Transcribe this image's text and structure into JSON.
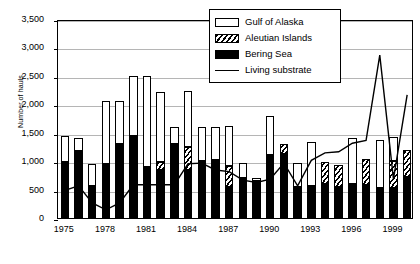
{
  "chart_data": {
    "type": "bar",
    "title": "",
    "xlabel": "",
    "ylabel": "Number of hauls",
    "ylim": [
      0,
      3500
    ],
    "ytick_labels": [
      "0",
      "500",
      "1,000",
      "1,500",
      "2,000",
      "2,500",
      "3,000",
      "3,500"
    ],
    "ytick_values": [
      0,
      500,
      1000,
      1500,
      2000,
      2500,
      3000,
      3500
    ],
    "grid": true,
    "stacked": true,
    "legend_position": "top-right",
    "categories": [
      1975,
      1976,
      1977,
      1978,
      1979,
      1980,
      1981,
      1982,
      1983,
      1984,
      1985,
      1986,
      1987,
      1988,
      1989,
      1990,
      1991,
      1992,
      1993,
      1994,
      1995,
      1996,
      1997,
      1998,
      1999,
      2000
    ],
    "xtick_labels": [
      "1975",
      "1978",
      "1981",
      "1984",
      "1987",
      "1990",
      "1993",
      "1996",
      "1999"
    ],
    "xtick_values": [
      1975,
      1978,
      1981,
      1984,
      1987,
      1990,
      1993,
      1996,
      1999
    ],
    "series": [
      {
        "name": "Bering Sea",
        "type": "bar",
        "color": "#000000",
        "values": [
          980,
          1170,
          560,
          950,
          1300,
          1450,
          900,
          850,
          1300,
          850,
          1000,
          1020,
          550,
          700,
          650,
          1100,
          1130,
          550,
          560,
          600,
          550,
          600,
          580,
          520,
          520,
          720
        ]
      },
      {
        "name": "Aleutian Islands",
        "type": "bar",
        "color": "#ffffff",
        "pattern": "diagonal-hatch",
        "values": [
          0,
          0,
          0,
          0,
          0,
          0,
          0,
          130,
          0,
          400,
          0,
          0,
          370,
          0,
          0,
          0,
          170,
          0,
          0,
          380,
          380,
          0,
          460,
          0,
          480,
          480
        ]
      },
      {
        "name": "Gulf of Alaska",
        "type": "bar",
        "color": "#ffffff",
        "values": [
          470,
          240,
          390,
          1100,
          750,
          1050,
          1600,
          1240,
          300,
          980,
          600,
          580,
          700,
          270,
          60,
          700,
          0,
          420,
          780,
          0,
          0,
          800,
          0,
          860,
          420,
          0
        ]
      },
      {
        "name": "Living substrate",
        "type": "line",
        "color": "#000000",
        "values": [
          520,
          600,
          300,
          180,
          300,
          620,
          620,
          620,
          620,
          990,
          1000,
          880,
          850,
          700,
          660,
          720,
          1000,
          600,
          1050,
          1180,
          1200,
          1350,
          1400,
          2900,
          720,
          2200
        ]
      }
    ],
    "legend": [
      {
        "label": "Gulf of Alaska",
        "key": "hollow-bar"
      },
      {
        "label": "Aleutian Islands",
        "key": "hatched-bar"
      },
      {
        "label": "Bering Sea",
        "key": "filled-bar"
      },
      {
        "label": "Living substrate",
        "key": "line"
      }
    ]
  }
}
